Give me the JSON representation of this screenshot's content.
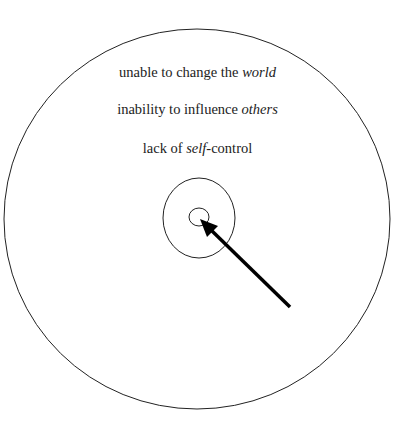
{
  "diagram": {
    "type": "concentric-circles",
    "labels": [
      {
        "plain": "unable to change the ",
        "italic": "world",
        "suffix": ""
      },
      {
        "plain": "inability to influence ",
        "italic": "others",
        "suffix": ""
      },
      {
        "plain": "lack of ",
        "italic": "self",
        "suffix": "-control"
      }
    ],
    "circles": [
      {
        "name": "outer",
        "cx": 197,
        "cy": 219,
        "rx": 193,
        "ry": 190
      },
      {
        "name": "middle",
        "cx": 199,
        "cy": 218,
        "rx": 36,
        "ry": 40
      },
      {
        "name": "inner",
        "cx": 199,
        "cy": 217,
        "rx": 10,
        "ry": 9
      }
    ],
    "arrow": {
      "from": [
        290,
        307
      ],
      "to": [
        200,
        219
      ]
    },
    "colors": {
      "stroke": "#222222",
      "text": "#222222",
      "background": "#ffffff"
    }
  }
}
